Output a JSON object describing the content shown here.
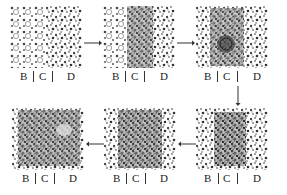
{
  "figure": {
    "panels": [
      {
        "index": 1,
        "row": 1,
        "col": 1,
        "labels": [
          "B",
          "C",
          "D"
        ],
        "state": "ordered lattice in B and C, disordered in D"
      },
      {
        "index": 2,
        "row": 1,
        "col": 2,
        "labels": [
          "B",
          "C",
          "D"
        ],
        "state": "disorder spreading into C"
      },
      {
        "index": 3,
        "row": 1,
        "col": 3,
        "labels": [
          "B",
          "C",
          "D"
        ],
        "state": "dense cluster with void forming in C"
      },
      {
        "index": 4,
        "row": 2,
        "col": 3,
        "labels": [
          "B",
          "C",
          "D"
        ],
        "state": "large dense cluster centered on C"
      },
      {
        "index": 5,
        "row": 2,
        "col": 2,
        "labels": [
          "B",
          "C",
          "D"
        ],
        "state": "dense region covering C and part of D"
      },
      {
        "index": 6,
        "row": 2,
        "col": 1,
        "labels": [
          "B",
          "C",
          "D"
        ],
        "state": "dense disordered region across B, C, D"
      }
    ],
    "arrows": [
      {
        "from": 1,
        "to": 2,
        "direction": "right"
      },
      {
        "from": 2,
        "to": 3,
        "direction": "right"
      },
      {
        "from": 3,
        "to": 4,
        "direction": "down"
      },
      {
        "from": 4,
        "to": 5,
        "direction": "left"
      },
      {
        "from": 5,
        "to": 6,
        "direction": "left"
      }
    ],
    "region_labels": {
      "b": "B",
      "c": "C",
      "d": "D"
    },
    "colors": {
      "background": "#ffffff",
      "ink": "#222222",
      "particle_dark": "#333333",
      "particle_light": "#9a9a9a"
    }
  }
}
